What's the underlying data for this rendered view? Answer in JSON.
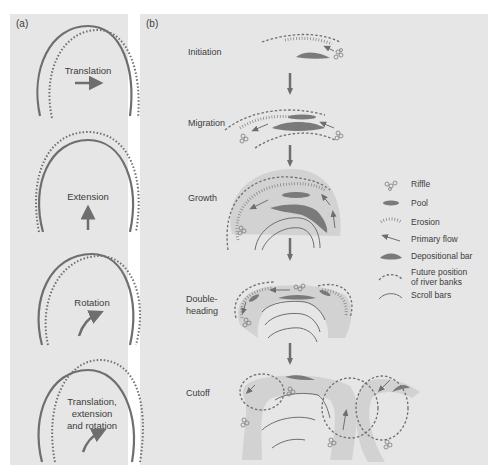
{
  "panel_a": {
    "label": "(a)",
    "modes": [
      {
        "lines": [
          "Translation"
        ],
        "arrow": "right"
      },
      {
        "lines": [
          "Extension"
        ],
        "arrow": "up"
      },
      {
        "lines": [
          "Rotation"
        ],
        "arrow": "curved"
      },
      {
        "lines": [
          "Translation,",
          "extension",
          "and rotation"
        ],
        "arrow": "curved"
      }
    ]
  },
  "panel_b": {
    "label": "(b)",
    "stages": [
      {
        "lines": [
          "Initiation"
        ]
      },
      {
        "lines": [
          "Migration"
        ]
      },
      {
        "lines": [
          "Growth"
        ]
      },
      {
        "lines": [
          "Double-",
          "heading"
        ]
      },
      {
        "lines": [
          "Cutoff"
        ]
      }
    ],
    "legend": [
      {
        "icon": "riffle-icon",
        "lines": [
          "Riffle"
        ]
      },
      {
        "icon": "pool-icon",
        "lines": [
          "Pool"
        ]
      },
      {
        "icon": "erosion-icon",
        "lines": [
          "Erosion"
        ]
      },
      {
        "icon": "primary-flow-icon",
        "lines": [
          "Primary flow"
        ]
      },
      {
        "icon": "depositional-bar-icon",
        "lines": [
          "Depositional bar"
        ]
      },
      {
        "icon": "future-bank-icon",
        "lines": [
          "Future position",
          "of river banks"
        ]
      },
      {
        "icon": "scroll-bar-icon",
        "lines": [
          "Scroll bars"
        ]
      }
    ]
  },
  "colors": {
    "panel_bg": "#e6e6e6",
    "line": "#6e6e6e",
    "channel": "#d2d2d2",
    "dark_fill": "#7a7a7a",
    "text": "#3c3c3c"
  }
}
